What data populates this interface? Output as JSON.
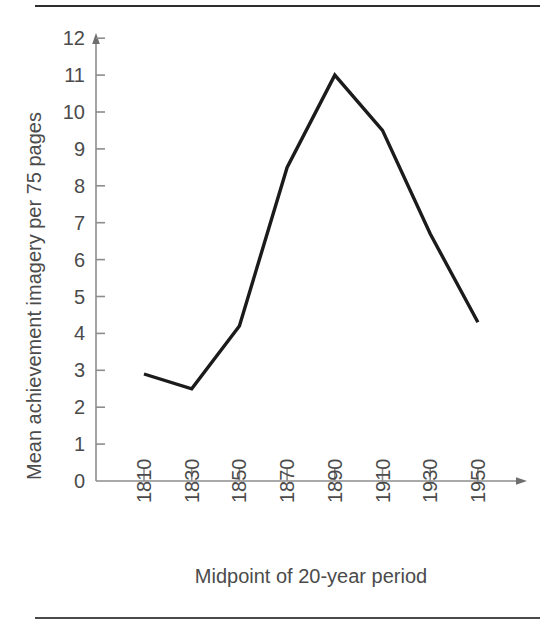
{
  "figure": {
    "rule_top_label": "horizontal-rule-top",
    "rule_bottom_label": "horizontal-rule-bottom"
  },
  "chart_data": {
    "type": "line",
    "title": "",
    "subtitle": "",
    "xlabel": "Midpoint of 20-year period",
    "ylabel": "Mean achievement imagery per 75 pages",
    "categories": [
      "1810",
      "1830",
      "1850",
      "1870",
      "1890",
      "1910",
      "1930",
      "1950"
    ],
    "x": [
      1810,
      1830,
      1850,
      1870,
      1890,
      1910,
      1930,
      1950
    ],
    "values": [
      2.9,
      2.5,
      4.2,
      8.5,
      11.0,
      9.5,
      6.7,
      4.3
    ],
    "series": [
      {
        "name": "Mean achievement imagery per 75 pages",
        "values": [
          2.9,
          2.5,
          4.2,
          8.5,
          11.0,
          9.5,
          6.7,
          4.3
        ],
        "color": "#1b1b1b"
      }
    ],
    "ylim": [
      0,
      12
    ],
    "yticks": [
      0,
      1,
      2,
      3,
      4,
      5,
      6,
      7,
      8,
      9,
      10,
      11,
      12
    ],
    "ytick_labels": [
      "0",
      "1",
      "2",
      "3",
      "4",
      "5",
      "6",
      "7",
      "8",
      "9",
      "10",
      "11",
      "12"
    ],
    "xtick_labels": [
      "1810",
      "1830",
      "1850",
      "1870",
      "1890",
      "1910",
      "1930",
      "1950"
    ],
    "xtick_rotation": 90,
    "grid": false,
    "legend": false,
    "legend_position": "none",
    "line_color": "#1b1b1b",
    "axis_color": "#8d8d8d",
    "text_color": "#4b4b4b",
    "background": "#ffffff",
    "markers": false,
    "annotations": []
  }
}
